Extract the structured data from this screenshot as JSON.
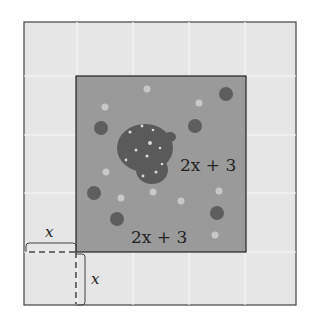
{
  "diagram": {
    "garden_width_label": "2x + 3",
    "garden_height_label": "2x + 3",
    "border_width_label": "x",
    "border_height_label": "x",
    "colors": {
      "path_tiles": "#e6e6e6",
      "tile_grid": "#f4f4f4",
      "garden": "#9a9a9a",
      "pond": "#5c5c5c",
      "outline": "#333333"
    }
  }
}
